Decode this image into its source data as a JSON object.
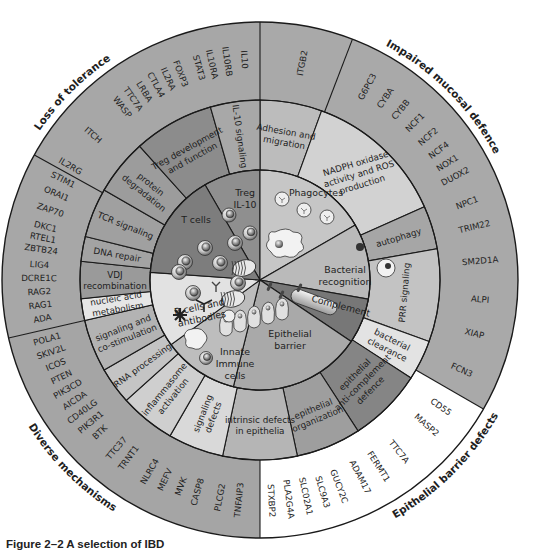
{
  "figure": {
    "caption": "Figure 2–2  A selection of IBD",
    "center": [
      260,
      280
    ],
    "radii": {
      "inner": 110,
      "middle": 180,
      "outer": 258
    }
  },
  "groups": [
    {
      "label": "Loss of tolerance",
      "angle": 315
    },
    {
      "label": "Impaired mucosal defence",
      "angle": 45
    },
    {
      "label": "Epithelial barrier defects",
      "angle": 135
    },
    {
      "label": "Diverse mechanisms",
      "angle": 225
    }
  ],
  "cell_types": [
    {
      "label": "Treg\nIL-10",
      "start": 330,
      "end": 360,
      "color": "#8f8f8f"
    },
    {
      "label": "Phagocytes",
      "start": 0,
      "end": 60,
      "color": "#c6c6c6"
    },
    {
      "label": "Bacterial\nrecognition",
      "start": 60,
      "end": 100,
      "color": "#bababa"
    },
    {
      "label": "Complement",
      "start": 100,
      "end": 124,
      "color": "#777777"
    },
    {
      "label": "Epithelial\nbarrier",
      "start": 124,
      "end": 194,
      "color": "#a9a9a9"
    },
    {
      "label": "Innate\nImmune\ncells",
      "start": 194,
      "end": 234,
      "color": "#bdbdbd"
    },
    {
      "label": "B cells and\nantibodies",
      "start": 234,
      "end": 274,
      "color": "#e2e2e2"
    },
    {
      "label": "T cells",
      "start": 274,
      "end": 330,
      "color": "#7d7d7d"
    }
  ],
  "mechanisms": [
    {
      "label": "Adhesion and\nmigration",
      "start": 0,
      "end": 20,
      "color": "#bcbcbc"
    },
    {
      "label": "NADPH oxidase\nactivity and ROS\nproduction",
      "start": 20,
      "end": 66,
      "color": "#d2d2d2"
    },
    {
      "label": "autophagy",
      "start": 66,
      "end": 80,
      "color": "#a6a6a6"
    },
    {
      "label": "PRR signaling",
      "start": 80,
      "end": 110,
      "color": "#c3c3c3"
    },
    {
      "label": "bacterial\nclearance",
      "start": 110,
      "end": 123,
      "color": "#e3e3e3"
    },
    {
      "label": "epithelial\nanti-complement\ndefence",
      "start": 123,
      "end": 147,
      "color": "#858585"
    },
    {
      "label": "epithelial\norganization",
      "start": 147,
      "end": 168,
      "color": "#9e9e9e"
    },
    {
      "label": "intrinsic defects\nin epithelia",
      "start": 168,
      "end": 192,
      "color": "#b5b5b5"
    },
    {
      "label": "signaling\ndefects",
      "start": 192,
      "end": 210,
      "color": "#d9d9d9"
    },
    {
      "label": "inflammasome\nactivation",
      "start": 210,
      "end": 228,
      "color": "#cfcfcf"
    },
    {
      "label": "RNA processing",
      "start": 228,
      "end": 240,
      "color": "#c4c4c4"
    },
    {
      "label": "signaling and\nco-stimulation",
      "start": 240,
      "end": 257,
      "color": "#b3b3b3"
    },
    {
      "label": "nucleic acid\nmetabolism",
      "start": 257,
      "end": 264,
      "color": "#e6e6e6"
    },
    {
      "label": "VDJ\nrecombination",
      "start": 264,
      "end": 276,
      "color": "#9a9a9a"
    },
    {
      "label": "DNA repair",
      "start": 276,
      "end": 284,
      "color": "#a3a3a3"
    },
    {
      "label": "TCR signaling",
      "start": 284,
      "end": 300,
      "color": "#a0a0a0"
    },
    {
      "label": "protein\ndegradation",
      "start": 300,
      "end": 318,
      "color": "#9c9c9c"
    },
    {
      "label": "Treg development\nand function",
      "start": 318,
      "end": 344,
      "color": "#8c8c8c"
    },
    {
      "label": "IL-10 signaling",
      "start": 344,
      "end": 360,
      "color": "#a8a8a8"
    }
  ],
  "outer_sectors": [
    {
      "start": 0,
      "end": 120,
      "color": "#a9a9a9"
    },
    {
      "start": 120,
      "end": 180,
      "color": "#ffffff"
    },
    {
      "start": 180,
      "end": 257,
      "color": "#a5a5a5"
    },
    {
      "start": 257,
      "end": 360,
      "color": "#a7a7a7"
    }
  ],
  "outer_dividers": [
    0,
    21,
    120,
    180,
    257,
    299
  ],
  "genes": [
    {
      "label": "IL10",
      "angle": 356
    },
    {
      "label": "IL10RB",
      "angle": 351.5
    },
    {
      "label": "IL10RA",
      "angle": 347.5
    },
    {
      "label": "STAT3",
      "angle": 344
    },
    {
      "label": "FOXP3",
      "angle": 339
    },
    {
      "label": "IL2RA",
      "angle": 335.5
    },
    {
      "label": "CTLA4",
      "angle": 332
    },
    {
      "label": "LRBA",
      "angle": 328.5
    },
    {
      "label": "TTC7A",
      "angle": 325
    },
    {
      "label": "WASP",
      "angle": 321.5
    },
    {
      "label": "ITCH",
      "angle": 311
    },
    {
      "label": "IL2RG",
      "angle": 301
    },
    {
      "label": "STIM1",
      "angle": 297
    },
    {
      "label": "ORAI1",
      "angle": 293
    },
    {
      "label": "ZAP70",
      "angle": 288.5
    },
    {
      "label": "DKC1",
      "angle": 284
    },
    {
      "label": "RTEL1",
      "angle": 281
    },
    {
      "label": "ZBTB24",
      "angle": 278
    },
    {
      "label": "LIG4",
      "angle": 274
    },
    {
      "label": "DCRE1C",
      "angle": 270.5
    },
    {
      "label": "RAG2",
      "angle": 267
    },
    {
      "label": "RAG1",
      "angle": 263.5
    },
    {
      "label": "ADA",
      "angle": 260
    },
    {
      "label": "POLA1",
      "angle": 254.5
    },
    {
      "label": "SKIV2L",
      "angle": 251
    },
    {
      "label": "ICOS",
      "angle": 247.5
    },
    {
      "label": "PTEN",
      "angle": 244
    },
    {
      "label": "PIK3CD",
      "angle": 240.5
    },
    {
      "label": "AICDA",
      "angle": 237
    },
    {
      "label": "CD40LG",
      "angle": 233.5
    },
    {
      "label": "PIK3R1",
      "angle": 230
    },
    {
      "label": "BTK",
      "angle": 226.5
    },
    {
      "label": "TTC37",
      "angle": 220.5
    },
    {
      "label": "TRNT1",
      "angle": 216.5
    },
    {
      "label": "NLRC4",
      "angle": 210
    },
    {
      "label": "MEFV",
      "angle": 205.5
    },
    {
      "label": "MVK",
      "angle": 201
    },
    {
      "label": "CASP8",
      "angle": 196.5
    },
    {
      "label": "PLCG2",
      "angle": 190.5
    },
    {
      "label": "TNFAIP3",
      "angle": 185.5
    },
    {
      "label": "STXBP2",
      "angle": 177
    },
    {
      "label": "PLA2G4A",
      "angle": 172.5
    },
    {
      "label": "SLC02A1",
      "angle": 168
    },
    {
      "label": "SLC9A3",
      "angle": 163.5
    },
    {
      "label": "GUCY2C",
      "angle": 159
    },
    {
      "label": "ADAM17",
      "angle": 153
    },
    {
      "label": "FERMT1",
      "angle": 147.5
    },
    {
      "label": "TTC7A",
      "angle": 141
    },
    {
      "label": "MASP2",
      "angle": 131
    },
    {
      "label": "CD55",
      "angle": 125
    },
    {
      "label": "FCN3",
      "angle": 114
    },
    {
      "label": "XIAP",
      "angle": 104
    },
    {
      "label": "ALPI",
      "angle": 95
    },
    {
      "label": "SM2D1A",
      "angle": 85
    },
    {
      "label": "TRIM22",
      "angle": 76
    },
    {
      "label": "NPC1",
      "angle": 69.5
    },
    {
      "label": "DUOX2",
      "angle": 62
    },
    {
      "label": "NOX1",
      "angle": 58
    },
    {
      "label": "NCF4",
      "angle": 54
    },
    {
      "label": "NCF2",
      "angle": 49.5
    },
    {
      "label": "NCF1",
      "angle": 44.5
    },
    {
      "label": "CYBB",
      "angle": 39.5
    },
    {
      "label": "CYBA",
      "angle": 34.5
    },
    {
      "label": "G6PC3",
      "angle": 29
    },
    {
      "label": "ITGB2",
      "angle": 11
    }
  ]
}
